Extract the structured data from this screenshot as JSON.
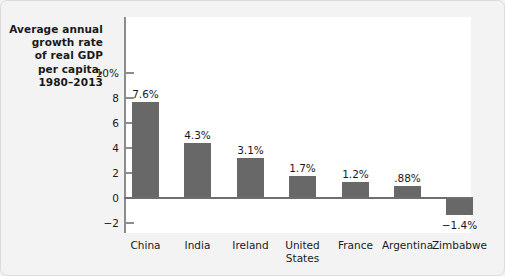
{
  "chart_data": {
    "type": "bar",
    "title": "Average annual growth rate of real GDP per capita, 1980–2013",
    "title_lines": [
      "Average annual",
      "growth rate",
      "of real GDP",
      "per capita,",
      "1980–2013"
    ],
    "xlabel": "",
    "ylabel": "Average annual growth rate of real GDP per capita, 1980–2013",
    "ylim": [
      -3.2,
      11.2
    ],
    "yticks": [
      10,
      8,
      6,
      4,
      2,
      0,
      -2
    ],
    "ytick_labels": [
      "10%",
      "8",
      "6",
      "4",
      "2",
      "0",
      "−2"
    ],
    "grid": false,
    "legend": false,
    "categories": [
      "China",
      "India",
      "Ireland",
      "United States",
      "France",
      "Argentina",
      "Zimbabwe"
    ],
    "category_label_lines": [
      [
        "China"
      ],
      [
        "India"
      ],
      [
        "Ireland"
      ],
      [
        "United",
        "States"
      ],
      [
        "France"
      ],
      [
        "Argentina"
      ],
      [
        "Zimbabwe"
      ]
    ],
    "values": [
      7.6,
      4.3,
      3.1,
      1.7,
      1.2,
      0.88,
      -1.4
    ],
    "value_labels": [
      "7.6%",
      "4.3%",
      "3.1%",
      "1.7%",
      "1.2%",
      ".88%",
      "−1.4%"
    ],
    "bar_color": "#686868",
    "panel_color": "#ffffff",
    "figure_color": "#f3f3f3",
    "axis_color": "#8c8c8c"
  }
}
